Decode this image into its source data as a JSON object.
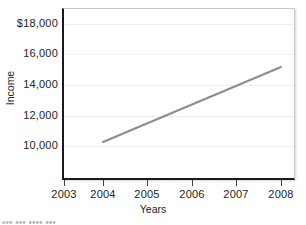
{
  "chart_data": {
    "type": "line",
    "title": "",
    "xlabel": "Years",
    "ylabel": "Income",
    "x": [
      2004,
      2008
    ],
    "values": [
      10500,
      15400
    ],
    "series": [
      {
        "name": "Income",
        "x": [
          2004,
          2008
        ],
        "values": [
          10500,
          15400
        ]
      }
    ],
    "xlim": [
      2002.6,
      2008.5
    ],
    "ylim": [
      8600,
      18600
    ],
    "xticks": [
      2003,
      2004,
      2005,
      2006,
      2007,
      2008
    ],
    "xticklabels": [
      "2003",
      "2004",
      "2005",
      "2006",
      "2007",
      "2008"
    ],
    "yticks": [
      10000,
      12000,
      14000,
      16000,
      18000
    ],
    "yticklabels": [
      "10,000",
      "12,000",
      "14,000",
      "16,000",
      "$18,000"
    ],
    "grid": "horizontal",
    "legend": "none",
    "line_color": "#8c8c8c",
    "line_width": 2,
    "annotations": []
  },
  "axes": {
    "y_ticks": [
      {
        "label": "$18,000",
        "top": 17
      },
      {
        "label": "16,000",
        "top": 47
      },
      {
        "label": "14,000",
        "top": 78
      },
      {
        "label": "12,000",
        "top": 109
      },
      {
        "label": "10,000",
        "top": 139
      }
    ],
    "gridlines_top": [
      23,
      53,
      84,
      115,
      145
    ],
    "x_ticks": [
      {
        "label": "2003",
        "left": 64
      },
      {
        "label": "2004",
        "left": 103
      },
      {
        "label": "2005",
        "left": 147
      },
      {
        "label": "2006",
        "left": 192
      },
      {
        "label": "2007",
        "left": 236
      },
      {
        "label": "2008",
        "left": 281
      }
    ]
  },
  "series_line": {
    "x1": 103,
    "y1": 142,
    "x2": 281,
    "y2": 67,
    "color": "#8c8c8c",
    "width": 2
  },
  "caption": {
    "clipped_text": "•••  •••            ••••   •••"
  }
}
